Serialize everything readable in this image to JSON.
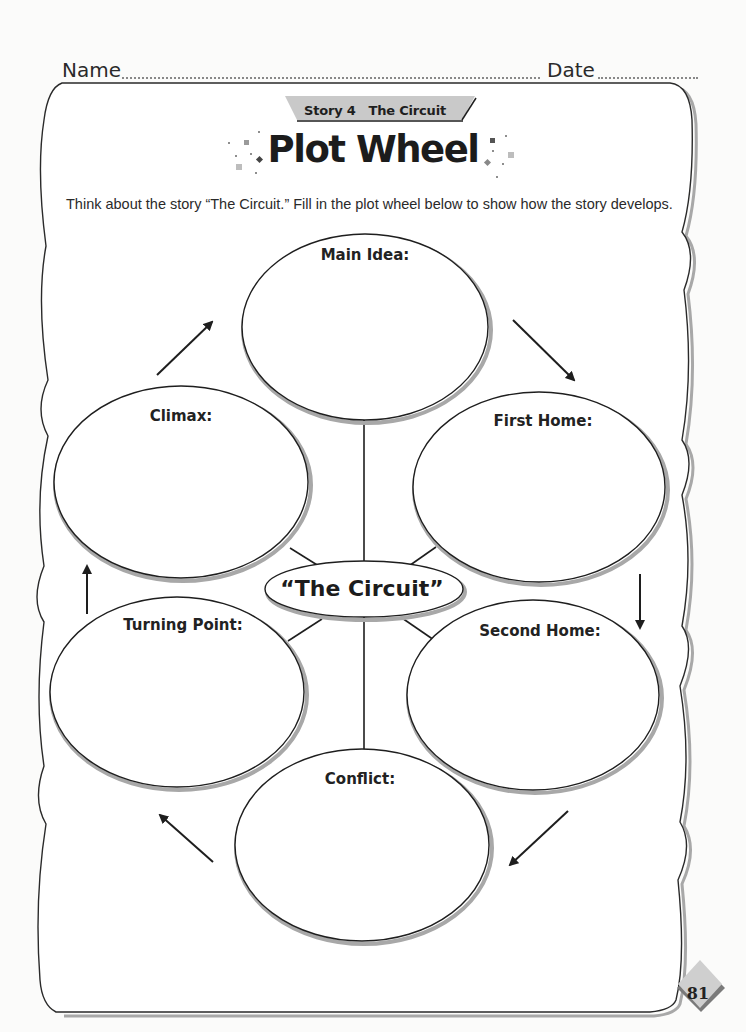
{
  "header": {
    "name_label": "Name",
    "date_label": "Date"
  },
  "story_tag": "Story 4   The Circuit",
  "title": "Plot Wheel",
  "instructions": "Think about the story “The Circuit.” Fill in the plot wheel below to show how the story develops.",
  "wheel": {
    "center": "“The Circuit”",
    "ovals": [
      {
        "id": "main-idea",
        "label": "Main Idea:"
      },
      {
        "id": "first-home",
        "label": "First Home:"
      },
      {
        "id": "second-home",
        "label": "Second Home:"
      },
      {
        "id": "conflict",
        "label": "Conflict:"
      },
      {
        "id": "turning-point",
        "label": "Turning Point:"
      },
      {
        "id": "climax",
        "label": "Climax:"
      }
    ],
    "arrow_order": [
      "Main Idea",
      "First Home",
      "Second Home",
      "Conflict",
      "Turning Point",
      "Climax",
      "Main Idea"
    ]
  },
  "page_number": "81",
  "colors": {
    "ink": "#1e1e1e",
    "shadow": "#a8a8a8",
    "tag_fill": "#c9c9c9",
    "page_badge": "#cfcfcf",
    "confetti": "#9a9a9a"
  }
}
